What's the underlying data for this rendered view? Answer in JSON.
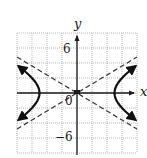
{
  "chart_data": {
    "type": "line",
    "title": "",
    "xlabel": "x",
    "ylabel": "y",
    "xlim": [
      -8,
      8
    ],
    "ylim": [
      -8,
      8
    ],
    "grid": true,
    "grid_step": 2,
    "tick_labels": {
      "y_positive": "6",
      "y_negative": "−6",
      "origin": "0"
    },
    "equation": "x^2/25 - y^2/9 = 1",
    "series": [
      {
        "name": "hyperbola",
        "style": "solid",
        "a": 5,
        "b": 3,
        "branches": [
          "left",
          "right"
        ],
        "vertices": [
          [
            -5,
            0
          ],
          [
            5,
            0
          ]
        ],
        "arrows_at_ends": true
      },
      {
        "name": "asymptote y = (3/5)x",
        "style": "dashed",
        "slope": 0.6,
        "points": [
          [
            -8,
            -4.8
          ],
          [
            8,
            4.8
          ]
        ]
      },
      {
        "name": "asymptote y = -(3/5)x",
        "style": "dashed",
        "slope": -0.6,
        "points": [
          [
            -8,
            4.8
          ],
          [
            8,
            -4.8
          ]
        ]
      }
    ]
  },
  "labels": {
    "x_axis": "x",
    "y_axis": "y",
    "y_tick_pos": "6",
    "y_tick_neg": "−6",
    "origin": "0"
  },
  "colors": {
    "grid": "#9a9a9a",
    "axis": "#1a1a1a",
    "curve": "#111111",
    "asymptote": "#333333"
  }
}
